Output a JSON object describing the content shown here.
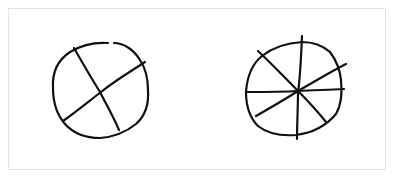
{
  "figure": {
    "stroke_color": "#111111",
    "background_color": "#ffffff",
    "border_color": "#e4e4e4",
    "circles": [
      {
        "name": "circle-quarters",
        "divisions": 4,
        "lines": 2
      },
      {
        "name": "circle-eighths",
        "divisions": 8,
        "lines": 4
      }
    ]
  }
}
